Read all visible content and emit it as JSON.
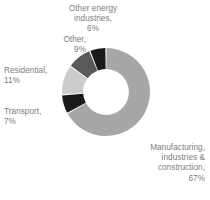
{
  "figure": {
    "background_color": "#ffffff",
    "label_color": "#7d7d7d"
  },
  "chart_data": {
    "type": "pie",
    "variant": "donut",
    "title": "",
    "subtitle": "",
    "xlabel": "",
    "ylabel": "",
    "legend_position": "none",
    "grid": false,
    "units": "percent",
    "total": 100,
    "start_angle_deg": 0,
    "direction": "clockwise",
    "inner_radius_ratio": 0.52,
    "categories": [
      "Manufacturing, industries & construction",
      "Transport",
      "Residential",
      "Other",
      "Other energy industries"
    ],
    "values": [
      67,
      7,
      11,
      9,
      6
    ],
    "colors": [
      "#a6a6a6",
      "#1a1a1a",
      "#cccccc",
      "#595959",
      "#1a1a1a"
    ],
    "slices": [
      {
        "name": "Manufacturing, industries & construction",
        "value": 67,
        "value_label": "67%",
        "color": "#a6a6a6",
        "label_text": "Manufacturing,\nindustries &\nconstruction,\n67%"
      },
      {
        "name": "Transport",
        "value": 7,
        "value_label": "7%",
        "color": "#1a1a1a",
        "label_text": "Transport,\n7%"
      },
      {
        "name": "Residential",
        "value": 11,
        "value_label": "11%",
        "color": "#cccccc",
        "label_text": "Residential,\n11%"
      },
      {
        "name": "Other",
        "value": 9,
        "value_label": "9%",
        "color": "#595959",
        "label_text": "Other,\n9%"
      },
      {
        "name": "Other energy industries",
        "value": 6,
        "value_label": "6%",
        "color": "#1a1a1a",
        "label_text": "Other energy\nindustries,\n6%"
      }
    ]
  }
}
